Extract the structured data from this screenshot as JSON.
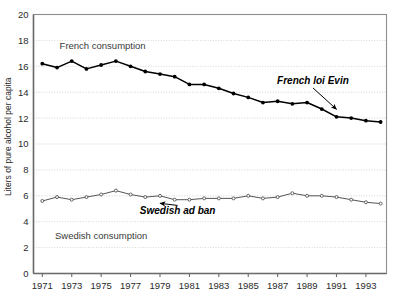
{
  "chart_data": {
    "type": "line",
    "title": "",
    "xlabel": "",
    "ylabel": "Liters of pure alcohol per capita",
    "xlim": [
      1970.4,
      1994.4
    ],
    "ylim": [
      0,
      20
    ],
    "grid": true,
    "legend": "inline-labels",
    "x": [
      1971,
      1972,
      1973,
      1974,
      1975,
      1976,
      1977,
      1978,
      1979,
      1980,
      1981,
      1982,
      1983,
      1984,
      1985,
      1986,
      1987,
      1988,
      1989,
      1990,
      1991,
      1992,
      1993,
      1994
    ],
    "xticks": [
      "1971",
      "1973",
      "1975",
      "1977",
      "1979",
      "1981",
      "1983",
      "1985",
      "1987",
      "1989",
      "1991",
      "1993"
    ],
    "xtick_values": [
      1971,
      1973,
      1975,
      1977,
      1979,
      1981,
      1983,
      1985,
      1987,
      1989,
      1991,
      1993
    ],
    "yticks": [
      "0",
      "2",
      "4",
      "6",
      "8",
      "10",
      "12",
      "14",
      "16",
      "18",
      "20"
    ],
    "ytick_values": [
      0,
      2,
      4,
      6,
      8,
      10,
      12,
      14,
      16,
      18,
      20
    ],
    "series": [
      {
        "name": "French consumption",
        "label": "French consumption",
        "marker": "filled-circle",
        "color": "#000000",
        "values": [
          16.2,
          15.9,
          16.4,
          15.8,
          16.1,
          16.4,
          16.0,
          15.6,
          15.4,
          15.2,
          14.6,
          14.6,
          14.3,
          13.9,
          13.6,
          13.2,
          13.3,
          13.1,
          13.2,
          12.7,
          12.1,
          12.0,
          11.8,
          11.7
        ]
      },
      {
        "name": "Swedish consumption",
        "label": "Swedish consumption",
        "marker": "open-circle",
        "color": "#555555",
        "values": [
          5.6,
          5.9,
          5.7,
          5.9,
          6.1,
          6.4,
          6.1,
          5.9,
          6.0,
          5.7,
          5.7,
          5.8,
          5.8,
          5.8,
          6.0,
          5.8,
          5.9,
          6.2,
          6.0,
          6.0,
          5.9,
          5.7,
          5.5,
          5.4
        ]
      }
    ],
    "annotations": [
      {
        "name": "french-loi-evin",
        "text": "French loi Evin",
        "target_x": 1991,
        "target_y": 12.1,
        "label_x": 1989.4,
        "label_y": 14.6
      },
      {
        "name": "swedish-ad-ban",
        "text": "Swedish ad ban",
        "target_x": 1979,
        "target_y": 6.0,
        "label_x": 1980.2,
        "label_y": 4.6
      }
    ],
    "series_inline_labels": [
      {
        "text": "French consumption",
        "x": 1975.1,
        "y": 17.3
      },
      {
        "text": "Swedish consumption",
        "x": 1975.0,
        "y": 2.7
      }
    ],
    "colors": {
      "axis": "#6b6b6b",
      "grid": "#cfcfcf",
      "french_line": "#000000",
      "swedish_line": "#555555",
      "text": "#2a2a2a",
      "background": "#ffffff"
    }
  }
}
